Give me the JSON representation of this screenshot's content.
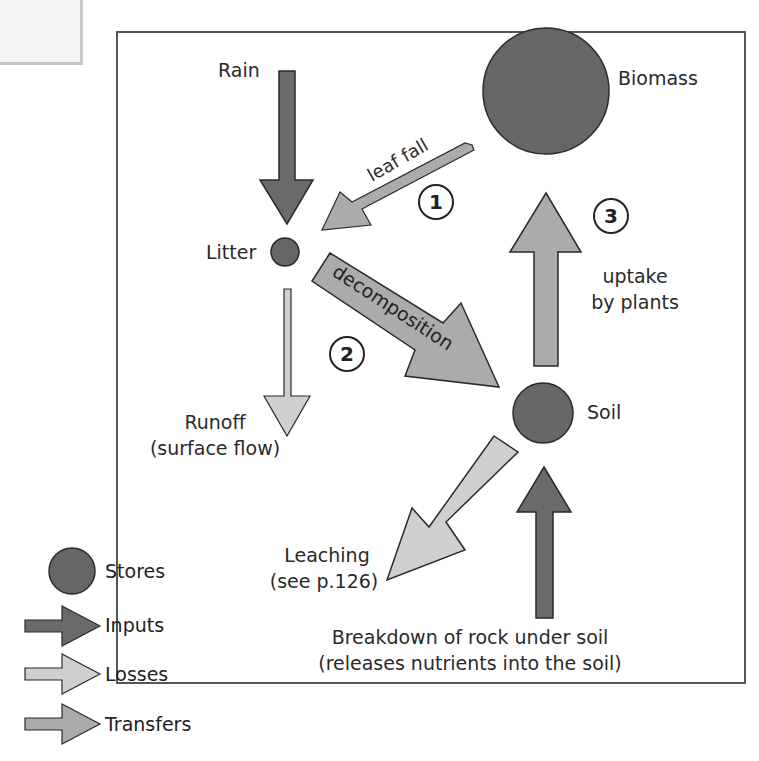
{
  "colors": {
    "store": "#666666",
    "input": "#6a6a6a",
    "loss": "#cfcfcf",
    "transfer": "#ababab",
    "stroke": "#2a2a2a",
    "border": "#555555"
  },
  "nodes": {
    "biomass": "Biomass",
    "litter": "Litter",
    "soil": "Soil"
  },
  "flows": {
    "rain": "Rain",
    "leaf_fall": "leaf fall",
    "decomposition": "decomposition",
    "uptake_line1": "uptake",
    "uptake_line2": "by plants",
    "runoff_line1": "Runoff",
    "runoff_line2": "(surface flow)",
    "leaching_line1": "Leaching",
    "leaching_line2": "(see p.126)",
    "breakdown_line1": "Breakdown of rock under soil",
    "breakdown_line2": "(releases nutrients into the soil)"
  },
  "numbers": [
    "1",
    "2",
    "3"
  ],
  "key": {
    "title": "Key",
    "items": [
      "Stores",
      "Inputs",
      "Losses",
      "Transfers"
    ]
  }
}
